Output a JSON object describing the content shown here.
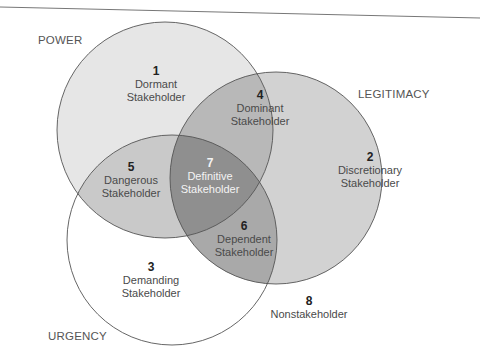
{
  "diagram": {
    "type": "venn",
    "colors": {
      "power_fill": "#e6e6e6",
      "legitimacy_fill": "#d2d2d2",
      "urgency_fill": "#ffffff",
      "overlap_pl": "#b8b8b8",
      "overlap_pu": "#c9c9c9",
      "overlap_lu": "#a9a9a9",
      "center": "#8f8f8f",
      "stroke": "#555555"
    },
    "sets": [
      {
        "name": "POWER"
      },
      {
        "name": "LEGITIMACY"
      },
      {
        "name": "URGENCY"
      }
    ],
    "regions": [
      {
        "number": "1",
        "line1": "Dormant",
        "line2": "Stakeholder"
      },
      {
        "number": "2",
        "line1": "Discretionary",
        "line2": "Stakeholder"
      },
      {
        "number": "3",
        "line1": "Demanding",
        "line2": "Stakeholder"
      },
      {
        "number": "4",
        "line1": "Dominant",
        "line2": "Stakeholder"
      },
      {
        "number": "5",
        "line1": "Dangerous",
        "line2": "Stakeholder"
      },
      {
        "number": "6",
        "line1": "Dependent",
        "line2": "Stakeholder"
      },
      {
        "number": "7",
        "line1": "Definitive",
        "line2": "Stakeholder"
      },
      {
        "number": "8",
        "line1": "Nonstakeholder"
      }
    ]
  }
}
